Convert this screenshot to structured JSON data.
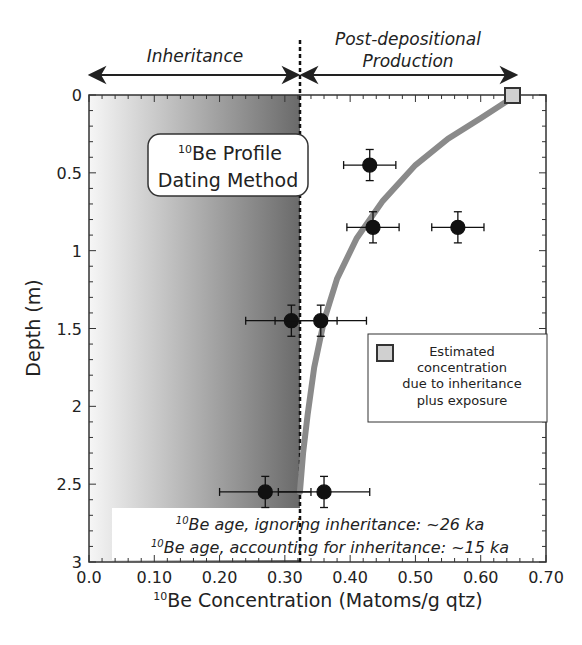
{
  "chart_data": {
    "type": "scatter",
    "title": "10Be Profile Dating Method",
    "xlabel": "10Be Concentration (Matoms/g qtz)",
    "ylabel": "Depth (m)",
    "xlim": [
      0.0,
      0.7
    ],
    "ylim": [
      3,
      0
    ],
    "y_inverted": true,
    "xticks": [
      "0.0",
      "0.10",
      "0.20",
      "0.30",
      "0.40",
      "0.50",
      "0.60",
      "0.70"
    ],
    "yticks": [
      "0",
      "0.5",
      "1",
      "1.5",
      "2",
      "2.5",
      "3"
    ],
    "grid": false,
    "inheritance_line_x": 0.32,
    "regions": [
      {
        "label": "Inheritance",
        "x_range": [
          0.0,
          0.32
        ]
      },
      {
        "label": "Post-depositional Production",
        "x_range": [
          0.32,
          0.65
        ]
      }
    ],
    "points": [
      {
        "x": 0.43,
        "y": 0.45,
        "xerr": 0.04,
        "yerr": 0.1
      },
      {
        "x": 0.435,
        "y": 0.85,
        "xerr": 0.04,
        "yerr": 0.1
      },
      {
        "x": 0.565,
        "y": 0.85,
        "xerr": 0.04,
        "yerr": 0.1
      },
      {
        "x": 0.31,
        "y": 1.45,
        "xerr": 0.07,
        "yerr": 0.1
      },
      {
        "x": 0.355,
        "y": 1.45,
        "xerr": 0.07,
        "yerr": 0.1
      },
      {
        "x": 0.27,
        "y": 2.55,
        "xerr": 0.07,
        "yerr": 0.1
      },
      {
        "x": 0.36,
        "y": 2.55,
        "xerr": 0.07,
        "yerr": 0.1
      }
    ],
    "model_curve": {
      "description": "Exponential decay of concentration with depth plus inheritance",
      "x": [
        0.655,
        0.6,
        0.55,
        0.5,
        0.45,
        0.41,
        0.38,
        0.36,
        0.345,
        0.335,
        0.328,
        0.323
      ],
      "y": [
        0.0,
        0.15,
        0.28,
        0.45,
        0.68,
        0.92,
        1.18,
        1.45,
        1.75,
        2.05,
        2.3,
        2.55
      ]
    },
    "estimated_marker": {
      "x": 0.655,
      "y": 0.0
    },
    "legend": [
      {
        "marker": "gray-square",
        "label": "Estimated concentration due to inheritance plus exposure"
      }
    ],
    "legend_position": "right-middle",
    "annotations": [
      "10Be age, ignoring inheritance: ~26 ka",
      "10Be age, accounting for inheritance: ~15 ka"
    ]
  },
  "labels": {
    "inheritance": "Inheritance",
    "post_line1": "Post-depositional",
    "post_line2": "Production",
    "title_sup": "10",
    "title_line1": "Be Profile",
    "title_line2": "Dating Method",
    "legend_line1": "Estimated",
    "legend_line2": "concentration",
    "legend_line3": "due to inheritance",
    "legend_line4": "plus exposure",
    "age1_sup": "10",
    "age1": "Be age, ignoring inheritance: ~26 ka",
    "age2_sup": "10",
    "age2": "Be age, accounting for inheritance: ~15 ka",
    "xlabel_sup": "10",
    "xlabel": "Be Concentration (Matoms/g qtz)",
    "ylabel": "Depth (m)"
  },
  "colors": {
    "shade_dark": "#6e6e6e",
    "shade_light": "#f4f4f4",
    "curve": "#8a8a8a",
    "marker_fill": "#d0d0d0",
    "points": "#111111"
  }
}
